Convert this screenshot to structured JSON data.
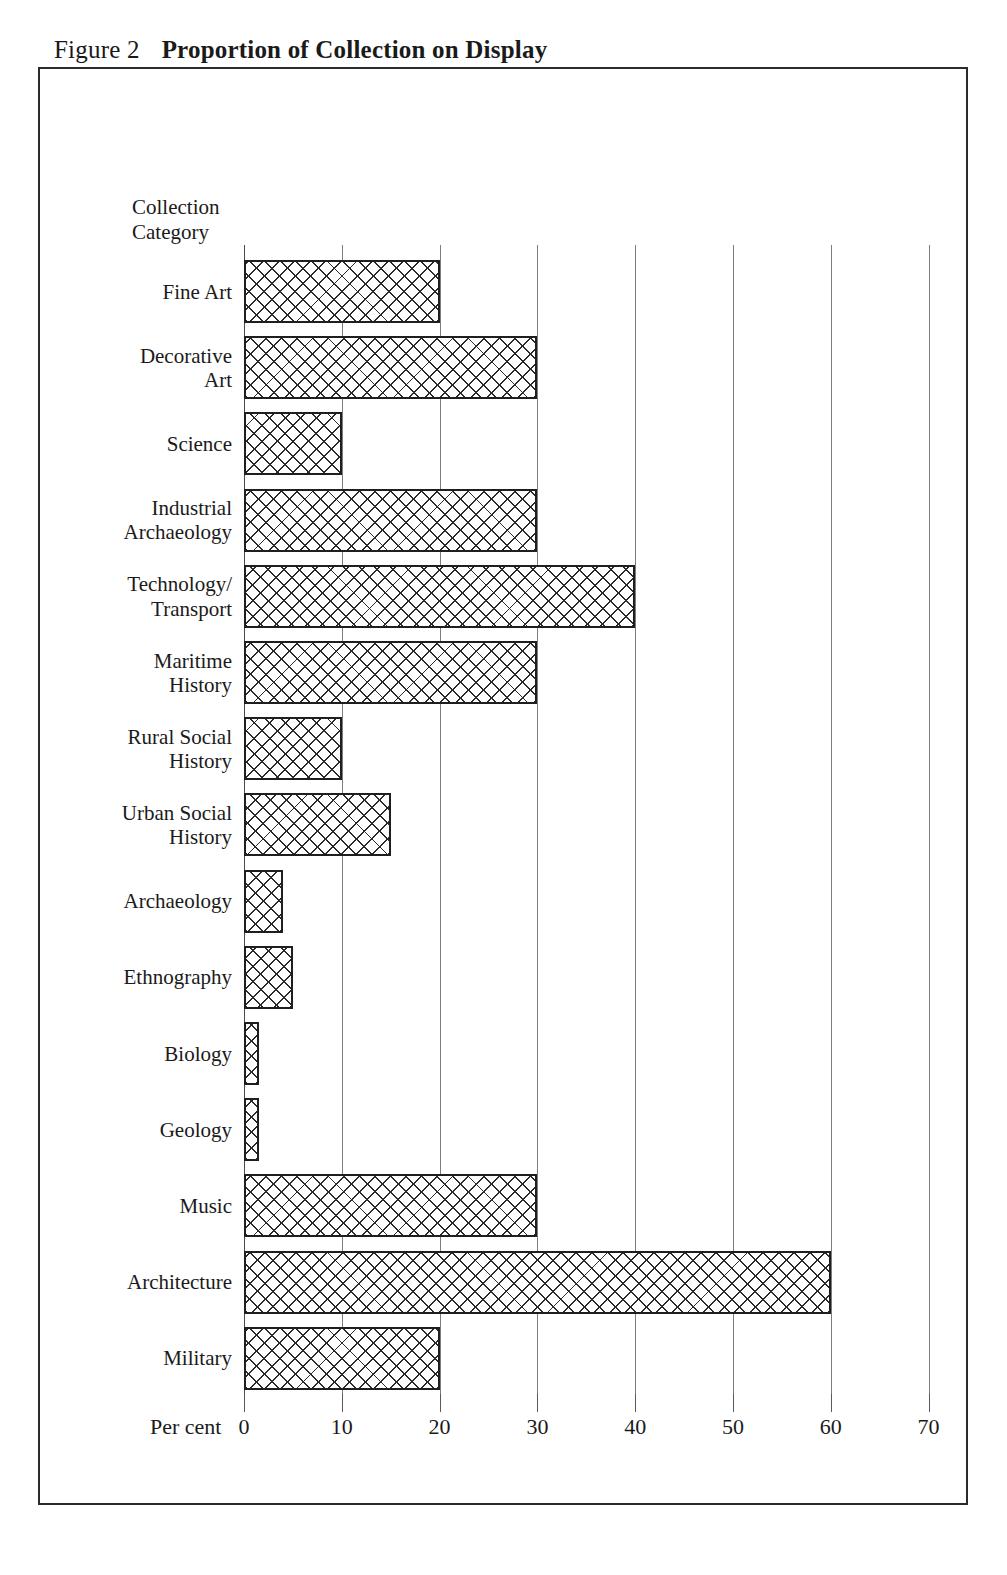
{
  "caption": {
    "figure_label": "Figure 2",
    "title": "Proportion of Collection on Display"
  },
  "axis_heading": "Collection\nCategory",
  "xaxis_title": "Per cent",
  "chart_data": {
    "type": "bar",
    "orientation": "horizontal",
    "title": "Proportion of Collection on Display",
    "xlabel": "Per cent",
    "ylabel": "Collection Category",
    "xlim": [
      0,
      70
    ],
    "xticks": [
      0,
      10,
      20,
      30,
      40,
      50,
      60,
      70
    ],
    "xticklabels": [
      "0",
      "10",
      "20",
      "30",
      "40",
      "50",
      "60",
      "70"
    ],
    "grid": true,
    "legend": false,
    "categories": [
      "Fine Art",
      "Decorative Art",
      "Science",
      "Industrial Archaeology",
      "Technology/ Transport",
      "Maritime History",
      "Rural Social History",
      "Urban Social History",
      "Archaeology",
      "Ethnography",
      "Biology",
      "Geology",
      "Music",
      "Architecture",
      "Military"
    ],
    "category_labels": [
      "Fine Art",
      "Decorative\nArt",
      "Science",
      "Industrial\nArchaeology",
      "Technology/\nTransport",
      "Maritime\nHistory",
      "Rural Social\nHistory",
      "Urban Social\nHistory",
      "Archaeology",
      "Ethnography",
      "Biology",
      "Geology",
      "Music",
      "Architecture",
      "Military"
    ],
    "values": [
      20,
      30,
      10,
      30,
      40,
      30,
      10,
      15,
      4,
      5,
      1.5,
      1.5,
      30,
      60,
      20
    ]
  },
  "colors": {
    "frame": "#2b2b2b",
    "gridline": "#7d7d7d",
    "bar_outline": "#1f1f1f",
    "bar_hatch": "#2a2a2a",
    "background": "#ffffff",
    "text": "#1a1a1a"
  }
}
